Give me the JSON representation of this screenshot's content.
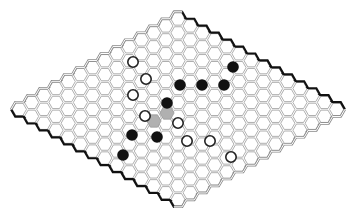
{
  "game": {
    "type": "hex",
    "board_size": 14,
    "colors": {
      "cell_stroke": "#9a9a9a",
      "cell_fill": "#ffffff",
      "highlight_fill": "#b0b0b0",
      "black_stone": "#111111",
      "white_stone_fill": "#ffffff",
      "white_stone_stroke": "#222222",
      "black_edge": "#111111",
      "white_edge": "#888888"
    },
    "black_stones": [
      [
        233,
        67
      ],
      [
        180,
        85
      ],
      [
        202,
        85
      ],
      [
        224,
        85
      ],
      [
        167,
        103
      ],
      [
        157,
        137
      ],
      [
        132,
        135
      ],
      [
        123,
        155
      ]
    ],
    "white_stones": [
      [
        133,
        62
      ],
      [
        146,
        79
      ],
      [
        133,
        95
      ],
      [
        145,
        116
      ],
      [
        178,
        123
      ],
      [
        187,
        141
      ],
      [
        210,
        141
      ],
      [
        231,
        157
      ]
    ],
    "highlighted_cells": [
      [
        154,
        121
      ],
      [
        167,
        113
      ]
    ]
  }
}
